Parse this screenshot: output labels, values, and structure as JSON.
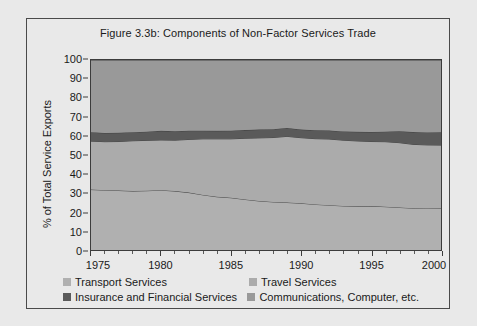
{
  "figure": {
    "title": "Figure 3.3b: Components of Non-Factor Services Trade"
  },
  "chart_data": {
    "type": "area",
    "title": "Figure 3.3b: Components of Non-Factor Services Trade",
    "xlabel": "",
    "ylabel": "% of Total Service Exports",
    "xlim": [
      1975,
      2000
    ],
    "ylim": [
      0,
      100
    ],
    "grid": false,
    "stacked": true,
    "legend_position": "bottom",
    "x_ticks": [
      1975,
      1980,
      1985,
      1990,
      1995,
      2000
    ],
    "y_ticks": [
      0,
      10,
      20,
      30,
      40,
      50,
      60,
      70,
      80,
      90,
      100
    ],
    "x": [
      1975,
      1976,
      1977,
      1978,
      1979,
      1980,
      1981,
      1982,
      1983,
      1984,
      1985,
      1986,
      1987,
      1988,
      1989,
      1990,
      1991,
      1992,
      1993,
      1994,
      1995,
      1996,
      1997,
      1998,
      1999,
      2000
    ],
    "series": [
      {
        "name": "Transport Services",
        "color": "#b0b0b0",
        "values": [
          31.8,
          31.5,
          31.3,
          31.0,
          31.2,
          31.5,
          31.0,
          30.2,
          29.0,
          28.0,
          27.5,
          26.6,
          25.8,
          25.3,
          25.0,
          24.6,
          24.0,
          23.6,
          23.2,
          23.0,
          23.1,
          22.8,
          22.4,
          22.0,
          21.9,
          22.0
        ]
      },
      {
        "name": "Travel Services",
        "color": "#ababab",
        "values": [
          25.5,
          25.5,
          25.8,
          26.5,
          26.5,
          26.4,
          26.8,
          28.0,
          29.5,
          30.5,
          31.0,
          32.2,
          33.2,
          33.9,
          34.8,
          34.5,
          34.6,
          34.8,
          34.6,
          34.4,
          34.0,
          34.2,
          34.1,
          33.6,
          33.4,
          33.2
        ]
      },
      {
        "name": "Insurance and Financial Services",
        "color": "#5a5a5a",
        "values": [
          4.7,
          4.6,
          4.6,
          4.5,
          4.6,
          4.8,
          4.7,
          4.6,
          4.3,
          4.2,
          4.3,
          4.3,
          4.4,
          4.4,
          4.4,
          4.3,
          4.4,
          4.5,
          4.6,
          4.8,
          5.0,
          5.3,
          6.0,
          6.5,
          6.6,
          6.8
        ]
      },
      {
        "name": "Communications, Computer, etc.",
        "color": "#999999",
        "values": [
          38.0,
          38.4,
          38.3,
          38.0,
          37.7,
          37.3,
          37.5,
          37.2,
          37.2,
          37.3,
          37.2,
          36.9,
          36.6,
          36.4,
          35.8,
          36.6,
          37.0,
          37.1,
          37.6,
          37.8,
          37.9,
          37.7,
          37.5,
          37.9,
          38.1,
          38.0
        ]
      }
    ],
    "legend": [
      {
        "label": "Transport Services",
        "color": "#b0b0b0"
      },
      {
        "label": "Travel Services",
        "color": "#ababab"
      },
      {
        "label": "Insurance and Financial Services",
        "color": "#5a5a5a"
      },
      {
        "label": "Communications, Computer, etc.",
        "color": "#999999"
      }
    ]
  }
}
